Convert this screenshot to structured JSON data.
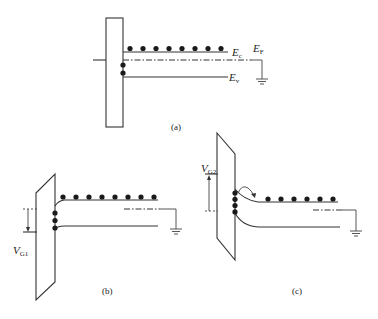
{
  "figure": {
    "panels": [
      {
        "id": "a",
        "caption": "(a)",
        "labels": {
          "conduction_band": {
            "main": "E",
            "sub": "c"
          },
          "fermi_level": {
            "main": "E",
            "sub": "F"
          },
          "valence_band": {
            "main": "E",
            "sub": "v"
          }
        },
        "conduction_electron_count": 8,
        "interface_charge_count": 2
      },
      {
        "id": "b",
        "caption": "(b)",
        "gate_voltage_label": {
          "main": "V",
          "sub": "G1"
        },
        "conduction_electron_count": 8,
        "interface_charge_count": 3
      },
      {
        "id": "c",
        "caption": "(c)",
        "gate_voltage_label": {
          "main": "V",
          "sub": "G2"
        },
        "conduction_electron_count": 6,
        "interface_charge_count": 4
      }
    ],
    "colors": {
      "ink": "#333333",
      "dot": "#1a1a1a",
      "background": "#ffffff"
    }
  }
}
